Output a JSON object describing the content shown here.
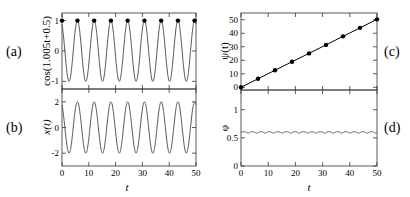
{
  "chart_data": [
    {
      "id": "a",
      "type": "line",
      "panel_label": "(a)",
      "ylabel": "cos(1.005t+0.5)",
      "xlabel": "",
      "xlim": [
        0,
        50
      ],
      "ylim": [
        -1.25,
        1.25
      ],
      "xticks": [
        0,
        10,
        20,
        30,
        40,
        50
      ],
      "xtick_labels_shown": false,
      "yticks": [
        -1,
        0,
        1
      ],
      "ytick_labels": [
        "-1",
        "0",
        "1"
      ],
      "grid": false,
      "series": [
        {
          "name": "cos(1.005t+0.5)",
          "function": "cos(1.005*t+0.5)",
          "style": "line",
          "color": "#555555"
        },
        {
          "name": "maxima markers",
          "style": "markers",
          "color": "#000000",
          "x": [
            0,
            5.75,
            12.0,
            18.25,
            24.5,
            30.75,
            37.0,
            43.25,
            49.5
          ],
          "y": [
            1,
            1,
            1,
            1,
            1,
            1,
            1,
            1,
            1
          ]
        }
      ]
    },
    {
      "id": "b",
      "type": "line",
      "panel_label": "(b)",
      "ylabel": "x(t)",
      "xlabel": "t",
      "xlim": [
        0,
        50
      ],
      "ylim": [
        -3,
        3
      ],
      "xticks": [
        0,
        10,
        20,
        30,
        40,
        50
      ],
      "xtick_labels": [
        "0",
        "10",
        "20",
        "30",
        "40",
        "50"
      ],
      "yticks": [
        -2,
        0,
        2
      ],
      "ytick_labels": [
        "-2",
        "0",
        "2"
      ],
      "grid": false,
      "series": [
        {
          "name": "x(t)",
          "function": "2*cos(1.005*t+0.5)",
          "amplitude": 2,
          "style": "line",
          "color": "#555555"
        }
      ]
    },
    {
      "id": "c",
      "type": "line",
      "panel_label": "(c)",
      "ylabel": "ψ(t)",
      "xlabel": "",
      "xlim": [
        0,
        50
      ],
      "ylim": [
        -2,
        55
      ],
      "xticks": [
        0,
        10,
        20,
        30,
        40,
        50
      ],
      "xtick_labels_shown": false,
      "yticks": [
        0,
        10,
        20,
        30,
        40,
        50
      ],
      "ytick_labels": [
        "0",
        "10",
        "20",
        "30",
        "40",
        "50"
      ],
      "grid": false,
      "series": [
        {
          "name": "ψ(t)",
          "style": "line+markers",
          "color": "#000000",
          "x": [
            0,
            6.25,
            12.5,
            18.75,
            25.0,
            31.25,
            37.5,
            43.75,
            50.0
          ],
          "y": [
            0,
            6.3,
            12.6,
            18.9,
            25.1,
            31.4,
            37.7,
            44.0,
            50.3
          ]
        }
      ]
    },
    {
      "id": "d",
      "type": "line",
      "panel_label": "(d)",
      "ylabel": "φ",
      "xlabel": "t",
      "xlim": [
        0,
        50
      ],
      "ylim": [
        0,
        1.35
      ],
      "xticks": [
        0,
        10,
        20,
        30,
        40,
        50
      ],
      "xtick_labels": [
        "0",
        "10",
        "20",
        "30",
        "40",
        "50"
      ],
      "yticks": [
        0,
        0.5,
        1
      ],
      "ytick_labels": [
        "0",
        "0.5",
        "1"
      ],
      "grid": false,
      "series": [
        {
          "name": "φ(t)",
          "function": "0.58 + 0.03*|sin(1.005*t+0.5)|",
          "mean": 0.58,
          "ripple_amplitude": 0.03,
          "style": "line",
          "color": "#555555"
        }
      ]
    }
  ]
}
